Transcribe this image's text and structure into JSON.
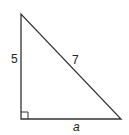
{
  "diagram": {
    "type": "right-triangle",
    "vertices": {
      "top": [
        21,
        14
      ],
      "right_angle": [
        21,
        119
      ],
      "bottom_right": [
        121,
        119
      ]
    },
    "labels": {
      "vertical_leg": "5",
      "hypotenuse": "7",
      "horizontal_leg": "a"
    },
    "right_angle_marker": true,
    "stroke_color": "#333333"
  }
}
